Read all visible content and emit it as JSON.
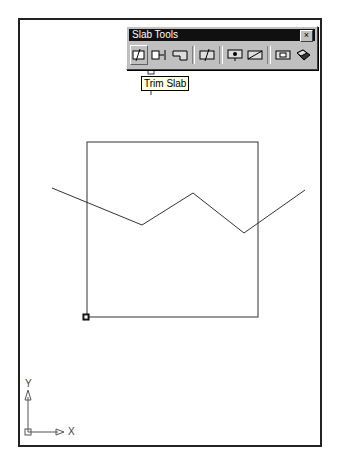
{
  "toolbar": {
    "title": "Slab Tools",
    "close_glyph": "×",
    "buttons": [
      {
        "name": "trim-slab",
        "icon": "trim-slab-icon",
        "active": true
      },
      {
        "name": "extend-slab",
        "icon": "extend-slab-icon"
      },
      {
        "name": "miter-slab",
        "icon": "miter-slab-icon"
      },
      {
        "name": "cut-slab",
        "icon": "cut-slab-icon"
      },
      {
        "name": "add-vertex",
        "icon": "add-vertex-icon"
      },
      {
        "name": "modify-edge",
        "icon": "modify-edge-icon"
      },
      {
        "name": "add-hole",
        "icon": "add-hole-icon"
      },
      {
        "name": "boolean-slab",
        "icon": "boolean-slab-icon"
      }
    ]
  },
  "tooltip": {
    "text": "Trim Slab"
  },
  "ucs": {
    "x_label": "X",
    "y_label": "Y"
  },
  "drawing": {
    "slab_rect": {
      "x": 87,
      "y": 142,
      "w": 171,
      "h": 175
    },
    "polyline": "52,188 142,225 193,193 244,233 305,190"
  }
}
